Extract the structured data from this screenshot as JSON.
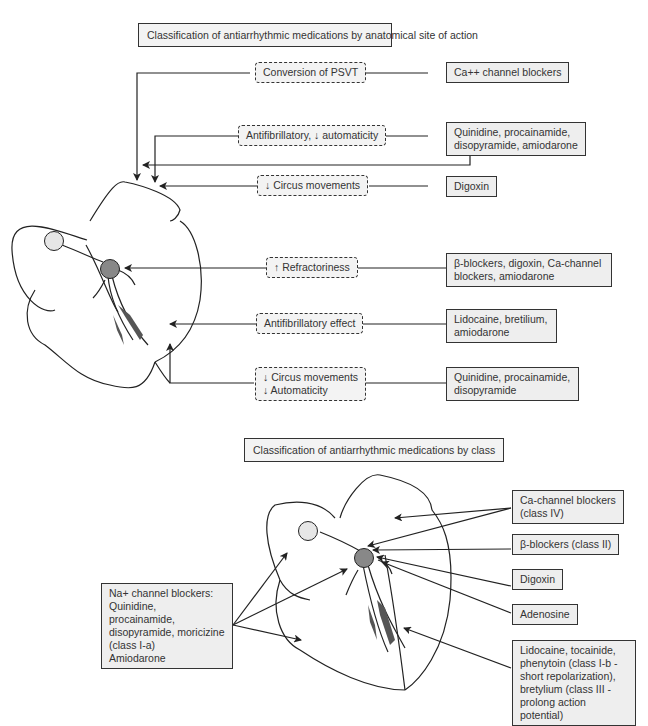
{
  "top_section": {
    "title": "Classification of antiarrhythmic medications by anatomical site of action",
    "effects": [
      {
        "label": "Conversion of PSVT",
        "drug": "Ca++ channel blockers"
      },
      {
        "label": "Antifibrillatory, ↓ automaticity",
        "drug_lines": [
          "Quinidine, procainamide,",
          "disopyramide, amiodarone"
        ]
      },
      {
        "label": "↓ Circus movements",
        "drug": "Digoxin"
      },
      {
        "label": "↑ Refractoriness",
        "drug_lines": [
          "β-blockers, digoxin, Ca-channel",
          "blockers, amiodarone"
        ]
      },
      {
        "label": "Antifibrillatory effect",
        "drug_lines": [
          "Lidocaine, bretilium,",
          "amiodarone"
        ]
      },
      {
        "label_lines": [
          "↓ Circus movements",
          "↓ Automaticity"
        ],
        "drug_lines": [
          "Quinidine, procainamide,",
          "disopyramide"
        ]
      }
    ]
  },
  "bottom_section": {
    "title": "Classification of antiarrhythmic medications by class",
    "right_boxes": [
      {
        "lines": [
          "Ca-channel blockers",
          "(class IV)"
        ]
      },
      {
        "lines": [
          "β-blockers (class II)"
        ]
      },
      {
        "lines": [
          "Digoxin"
        ]
      },
      {
        "lines": [
          "Adenosine"
        ]
      },
      {
        "lines": [
          "Lidocaine, tocainide,",
          "phenytoin (class I-b -",
          "short repolarization),",
          "bretylium (class III -",
          "prolong action potential)"
        ]
      }
    ],
    "left_box": {
      "lines": [
        "Na+ channel blockers:",
        "Quinidine, procainamide,",
        "disopyramide, moricizine",
        "(class I-a)",
        "Amiodarone"
      ]
    }
  },
  "colors": {
    "box_fill": "#eeeeee",
    "node_fill": "#888888",
    "sa_node_fill": "#e6e6e6",
    "line": "#222222"
  }
}
